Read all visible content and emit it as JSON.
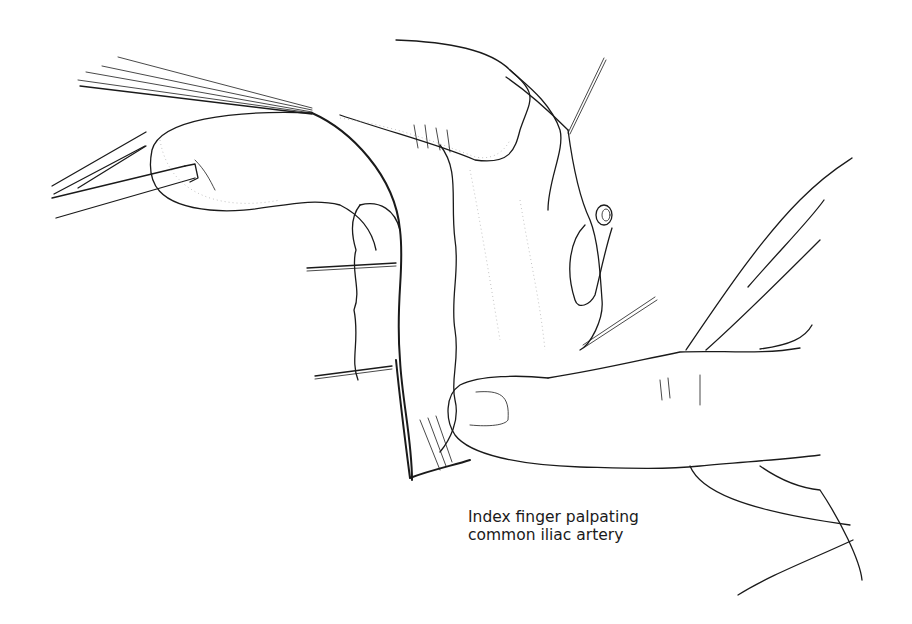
{
  "figure": {
    "type": "surgical line illustration",
    "subject": "Index finger palpating common iliac artery",
    "elements": [
      "forceps",
      "retraction sutures",
      "bowel / peritoneal tissue",
      "hand with index finger",
      "vessel stump"
    ]
  },
  "caption": {
    "line1": "Index finger palpating",
    "line2": "common iliac artery"
  },
  "colors": {
    "ink": "#1a1a1a",
    "stipple": "#9a9a9a",
    "background": "#ffffff"
  }
}
